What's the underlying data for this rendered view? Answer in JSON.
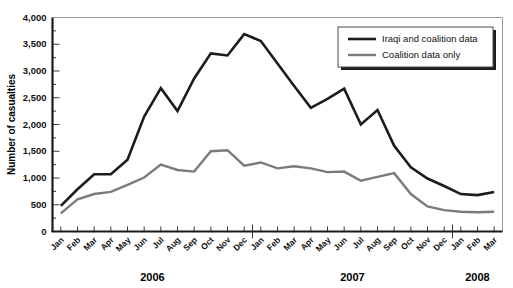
{
  "chart_data": {
    "type": "line",
    "title": "",
    "xlabel": "",
    "ylabel": "Number of casualties",
    "ylim": [
      0,
      4000
    ],
    "yticks": [
      0,
      500,
      1000,
      1500,
      2000,
      2500,
      3000,
      3500,
      4000
    ],
    "ytick_labels": [
      "0",
      "500",
      "1,000",
      "1,500",
      "2,000",
      "2,500",
      "3,000",
      "3,500",
      "4,000"
    ],
    "grid": false,
    "legend_position": "top-right",
    "categories": [
      "Jan",
      "Feb",
      "Mar",
      "Apr",
      "May",
      "Jun",
      "Jul",
      "Aug",
      "Sep",
      "Oct",
      "Nov",
      "Dec",
      "Jan",
      "Feb",
      "Mar",
      "Apr",
      "May",
      "Jun",
      "Jul",
      "Aug",
      "Sep",
      "Oct",
      "Nov",
      "Dec",
      "Jan",
      "Feb",
      "Mar"
    ],
    "year_groups": [
      {
        "label": "2006",
        "start_index": 0,
        "end_index": 11
      },
      {
        "label": "2007",
        "start_index": 12,
        "end_index": 23
      },
      {
        "label": "2008",
        "start_index": 24,
        "end_index": 26
      }
    ],
    "series": [
      {
        "name": "Iraqi and coalition data",
        "color": "#1c1c1c",
        "width": 2.6,
        "values": [
          480,
          790,
          1070,
          1070,
          1340,
          2150,
          2680,
          2250,
          2860,
          3330,
          3290,
          3690,
          3560,
          3140,
          2720,
          2310,
          2480,
          2670,
          2000,
          2270,
          1600,
          1200,
          990,
          850,
          700,
          680,
          740
        ]
      },
      {
        "name": "Coalition data only",
        "color": "#7b7b7b",
        "width": 2.4,
        "values": [
          340,
          600,
          700,
          740,
          870,
          1010,
          1250,
          1150,
          1120,
          1500,
          1520,
          1230,
          1290,
          1180,
          1220,
          1180,
          1110,
          1120,
          950,
          1020,
          1090,
          700,
          470,
          400,
          370,
          360,
          370
        ]
      }
    ]
  },
  "axis": {
    "y_title": "Number of casualties"
  }
}
